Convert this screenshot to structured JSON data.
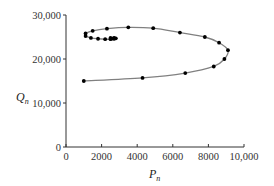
{
  "chart_data": {
    "type": "line",
    "title": "",
    "xlabel": "P_n",
    "ylabel": "Q_n",
    "xlim": [
      0,
      10000
    ],
    "ylim": [
      0,
      30000
    ],
    "grid": false,
    "legend": null,
    "x_ticks": [
      0,
      2000,
      4000,
      6000,
      8000,
      10000
    ],
    "x_tick_labels": [
      "0",
      "2000",
      "4000",
      "6000",
      "8000",
      "10,000"
    ],
    "y_ticks": [
      0,
      10000,
      20000,
      30000
    ],
    "y_tick_labels": [
      "0",
      "10,000",
      "20,000",
      "30,000"
    ],
    "series": [
      {
        "name": "trajectory",
        "line_color": "#808080",
        "marker_color": "#000000",
        "points": [
          [
            1000,
            15000
          ],
          [
            4300,
            15700
          ],
          [
            6700,
            16800
          ],
          [
            8300,
            18300
          ],
          [
            8900,
            20000
          ],
          [
            9100,
            22000
          ],
          [
            8600,
            23700
          ],
          [
            7800,
            25000
          ],
          [
            6400,
            26000
          ],
          [
            4900,
            27000
          ],
          [
            3500,
            27200
          ],
          [
            2300,
            26900
          ],
          [
            1500,
            26400
          ],
          [
            1100,
            25800
          ],
          [
            1100,
            25200
          ],
          [
            1400,
            24800
          ],
          [
            1800,
            24600
          ],
          [
            2200,
            24500
          ],
          [
            2500,
            24500
          ],
          [
            2700,
            24600
          ],
          [
            2800,
            24700
          ],
          [
            2700,
            24800
          ],
          [
            2500,
            24800
          ],
          [
            2600,
            24650
          ],
          [
            2700,
            24700
          ]
        ]
      }
    ]
  }
}
